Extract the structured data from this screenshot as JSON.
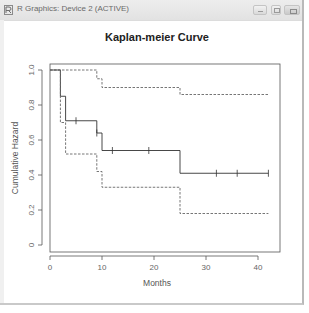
{
  "window": {
    "title": "R Graphics: Device 2 (ACTIVE)",
    "icon": "r-graphics-icon",
    "buttons": [
      "minimize",
      "maximize",
      "close"
    ]
  },
  "chart_data": {
    "type": "line",
    "title": "Kaplan-meier Curve",
    "xlabel": "Months",
    "ylabel": "Cumulative Hazard",
    "xlim": [
      0,
      43
    ],
    "ylim": [
      0,
      1.0
    ],
    "x_ticks": [
      0,
      10,
      20,
      30,
      40
    ],
    "x_tick_labels": [
      "0",
      "10",
      "20",
      "30",
      "40"
    ],
    "y_ticks": [
      0,
      0.2,
      0.4,
      0.6,
      0.8,
      1.0
    ],
    "y_tick_labels": [
      "0",
      "0.2",
      "0.4",
      "0.6",
      "0.8",
      "1.0"
    ],
    "grid": false,
    "legend": null,
    "series": [
      {
        "name": "Survival estimate",
        "style": "solid",
        "step": true,
        "x": [
          0,
          2,
          3,
          9,
          10,
          25,
          42
        ],
        "y": [
          1.0,
          0.85,
          0.71,
          0.64,
          0.54,
          0.41,
          0.41
        ],
        "censored": [
          {
            "x": 5,
            "y": 0.71
          },
          {
            "x": 9,
            "y": 0.64
          },
          {
            "x": 12,
            "y": 0.54
          },
          {
            "x": 19,
            "y": 0.54
          },
          {
            "x": 32,
            "y": 0.41
          },
          {
            "x": 36,
            "y": 0.41
          },
          {
            "x": 42,
            "y": 0.41
          }
        ]
      },
      {
        "name": "Upper 95% CI",
        "style": "dashed",
        "step": true,
        "x": [
          0,
          2,
          9,
          10,
          25,
          42
        ],
        "y": [
          1.0,
          1.0,
          0.95,
          0.9,
          0.86,
          0.86
        ]
      },
      {
        "name": "Lower 95% CI",
        "style": "dashed",
        "step": true,
        "x": [
          0,
          2,
          3,
          9,
          10,
          25,
          42
        ],
        "y": [
          1.0,
          0.7,
          0.52,
          0.42,
          0.33,
          0.18,
          0.18
        ]
      }
    ]
  }
}
